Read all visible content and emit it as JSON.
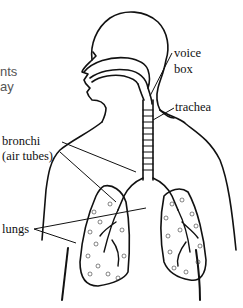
{
  "diagram": {
    "text_fragments": [
      "nts",
      "ay"
    ],
    "labels": {
      "voice_box": [
        "voice",
        "box"
      ],
      "trachea": "trachea",
      "bronchi": "bronchi",
      "bronchi_note": "(air tubes)",
      "lungs": "lungs"
    },
    "colors": {
      "line": "#111111",
      "background": "#ffffff",
      "fragment_text": "#555555"
    }
  }
}
